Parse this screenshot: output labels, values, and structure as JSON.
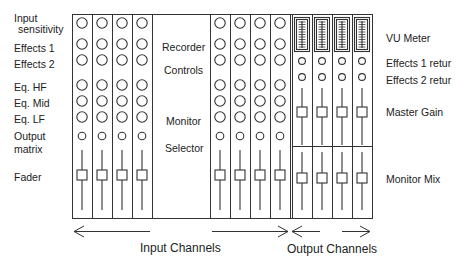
{
  "left_labels": [
    {
      "text": "Input",
      "x": 14,
      "y": 13
    },
    {
      "text": "sensitivity",
      "x": 18,
      "y": 24
    },
    {
      "text": "Effects 1",
      "x": 14,
      "y": 43
    },
    {
      "text": "Effects 2",
      "x": 14,
      "y": 59
    },
    {
      "text": "Eq.  HF",
      "x": 14,
      "y": 82
    },
    {
      "text": "Eq.  Mid",
      "x": 14,
      "y": 98
    },
    {
      "text": "Eq.  LF",
      "x": 14,
      "y": 114
    },
    {
      "text": "Output",
      "x": 14,
      "y": 131
    },
    {
      "text": "matrix",
      "x": 14,
      "y": 144
    },
    {
      "text": "Fader",
      "x": 14,
      "y": 172
    }
  ],
  "center_labels": [
    {
      "text": "Recorder",
      "x": 162,
      "y": 42
    },
    {
      "text": "Controls",
      "x": 164,
      "y": 65
    },
    {
      "text": "Monitor",
      "x": 166,
      "y": 116
    },
    {
      "text": "Selector",
      "x": 165,
      "y": 143
    }
  ],
  "right_labels": [
    {
      "text": "VU Meter",
      "x": 386,
      "y": 33
    },
    {
      "text": "Effects 1 retur",
      "x": 386,
      "y": 58
    },
    {
      "text": "Effects 2 retur",
      "x": 386,
      "y": 75
    },
    {
      "text": "Master Gain",
      "x": 386,
      "y": 107
    },
    {
      "text": "Monitor Mix",
      "x": 386,
      "y": 174
    }
  ],
  "bottom_labels": {
    "input_channels": "Input Channels",
    "output_channels": "Output Channels"
  },
  "layout": {
    "input_channel_count": 8,
    "output_channel_count": 4,
    "line_color": "#333333",
    "background": "#ffffff"
  }
}
